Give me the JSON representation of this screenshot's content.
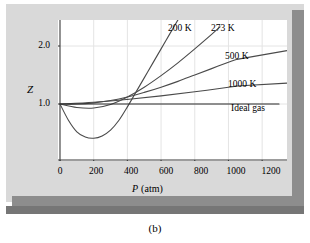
{
  "figure": {
    "caption": "(b)"
  },
  "chart_data": {
    "type": "line",
    "title": "",
    "xlabel": "P (atm)",
    "xlabel_symbol": "P",
    "xlabel_unit": "(atm)",
    "ylabel": "Z",
    "xlim": [
      0,
      1300
    ],
    "ylim": [
      0.25,
      2.45
    ],
    "xticks": [
      0,
      200,
      400,
      600,
      800,
      1000,
      1200
    ],
    "xticklabels": [
      "0",
      "200",
      "400",
      "600",
      "800",
      "1000",
      "1200"
    ],
    "yticks": [
      1.0,
      2.0
    ],
    "yticklabels": [
      "1.0",
      "2.0"
    ],
    "grid": true,
    "legend_position": "inline-right",
    "series": [
      {
        "name": "200 K",
        "label": "200 K",
        "color": "#4a4a4a",
        "x": [
          0,
          50,
          100,
          150,
          200,
          250,
          300,
          350,
          400,
          450,
          500,
          550,
          600,
          650,
          700
        ],
        "y": [
          1.0,
          0.72,
          0.52,
          0.43,
          0.41,
          0.45,
          0.55,
          0.72,
          0.95,
          1.2,
          1.45,
          1.7,
          1.95,
          2.2,
          2.45
        ]
      },
      {
        "name": "273 K",
        "label": "273 K",
        "color": "#4a4a4a",
        "x": [
          0,
          100,
          200,
          300,
          400,
          500,
          600,
          700,
          800,
          900,
          950
        ],
        "y": [
          1.0,
          0.94,
          0.93,
          0.99,
          1.12,
          1.29,
          1.49,
          1.71,
          1.95,
          2.2,
          2.33
        ]
      },
      {
        "name": "500 K",
        "label": "500 K",
        "color": "#4a4a4a",
        "x": [
          0,
          100,
          200,
          300,
          400,
          500,
          600,
          700,
          800,
          900,
          1000,
          1050
        ],
        "y": [
          1.0,
          1.0,
          1.02,
          1.06,
          1.12,
          1.2,
          1.29,
          1.39,
          1.5,
          1.61,
          1.72,
          1.77
        ]
      },
      {
        "name": "1000 K",
        "label": "1000 K",
        "color": "#4a4a4a",
        "x": [
          0,
          200,
          400,
          600,
          800,
          1000,
          1050
        ],
        "y": [
          1.0,
          1.03,
          1.08,
          1.14,
          1.21,
          1.29,
          1.31
        ]
      },
      {
        "name": "Ideal gas",
        "label": "Ideal gas",
        "color": "#2a2a2a",
        "x": [
          0,
          1300
        ],
        "y": [
          1.0,
          1.0
        ]
      }
    ]
  },
  "colors": {
    "panel_background": "#d9d9d9",
    "plot_background": "#ffffff",
    "shadow": "#8d8d8d",
    "dark_bar": "#767676",
    "axis": "#3a3a3a",
    "grid": "#e4e4e4"
  }
}
